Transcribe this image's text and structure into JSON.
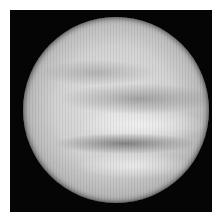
{
  "image": {
    "subject": "planet-venus-cloud-tops",
    "description": "Grayscale image of a planet with swirling cloud bands on a black background",
    "colors": {
      "border": "#ffffff",
      "background": "#050505",
      "planet_light": "#e6e6e6",
      "planet_dark": "#5a5a5a"
    }
  }
}
